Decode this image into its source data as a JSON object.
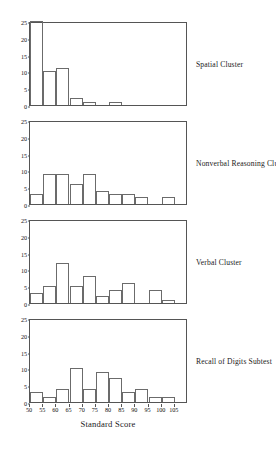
{
  "figure": {
    "xlabel": "Standard Score",
    "x_tick_labels": [
      "50",
      "55",
      "60",
      "65",
      "70",
      "75",
      "80",
      "85",
      "90",
      "95",
      "100",
      "105"
    ],
    "y_tick_labels": [
      "0",
      "5",
      "10",
      "15",
      "20",
      "25"
    ],
    "axis_color": "#555555",
    "bar_edge_color": "#6b6b6b",
    "bar_fill_color": "#ffffff"
  },
  "chart_data": {
    "type": "bar",
    "title": "",
    "xlabel": "Standard Score",
    "ylabel": "",
    "xlim": [
      50,
      105
    ],
    "ylim": [
      0,
      25
    ],
    "x_ticks": [
      50,
      55,
      60,
      65,
      70,
      75,
      80,
      85,
      90,
      95,
      100,
      105
    ],
    "y_ticks": [
      0,
      5,
      10,
      15,
      20,
      25
    ],
    "grid": false,
    "legend": "none",
    "bin_width": 5,
    "bin_starts": [
      50,
      55,
      60,
      65,
      70,
      75,
      80,
      85,
      90,
      95,
      100
    ],
    "categories": [
      "50-55",
      "55-60",
      "60-65",
      "65-70",
      "70-75",
      "75-80",
      "80-85",
      "85-90",
      "90-95",
      "95-100",
      "100-105"
    ],
    "panels": [
      {
        "label": "Spatial Cluster",
        "values": [
          25,
          10,
          11,
          2,
          1,
          0,
          1,
          0,
          0,
          0,
          0
        ]
      },
      {
        "label": "Nonverbal Reasoning Cluster",
        "values": [
          3,
          9,
          9,
          6,
          9,
          4,
          3,
          3,
          2,
          0,
          2
        ]
      },
      {
        "label": "Verbal Cluster",
        "values": [
          3,
          5,
          12,
          5,
          8,
          2,
          4,
          6,
          0,
          4,
          1
        ]
      },
      {
        "label": "Recall of Digits Subtest",
        "values": [
          3,
          1.5,
          4,
          10,
          4,
          9,
          7,
          3,
          4,
          1.5,
          1.5
        ]
      }
    ]
  }
}
